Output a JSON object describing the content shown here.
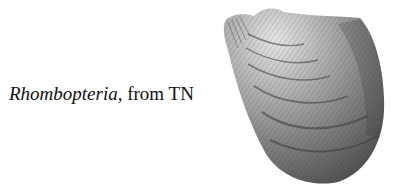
{
  "caption": {
    "genus": "Rhombopteria",
    "rest": ", from TN"
  },
  "figure": {
    "icon": "shell-illustration",
    "colors": {
      "background": "#ffffff",
      "shell_light": "#d9d9d9",
      "shell_mid": "#8c8c8c",
      "shell_dark": "#3a3a3a"
    }
  }
}
